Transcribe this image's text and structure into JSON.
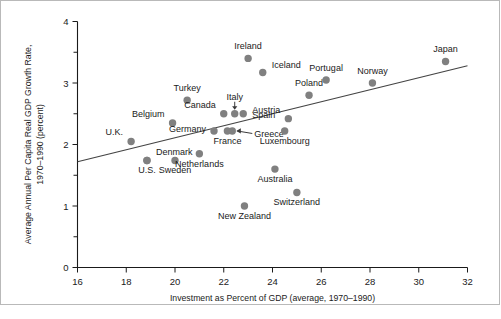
{
  "chart_data": {
    "type": "scatter",
    "title": "",
    "xlabel": "Investment as Percent of GDP (average, 1970–1990)",
    "ylabel": "Average Annual Per Capita Real GDP Growth Rate, 1970–1990 (percent)",
    "ylabel_line1": "Average Annual Per Capita Real GDP Growth Rate,",
    "ylabel_line2": "1970–1990 (percent)",
    "xlim": [
      16,
      32
    ],
    "ylim": [
      0,
      4
    ],
    "xticks": [
      16,
      18,
      20,
      22,
      24,
      26,
      28,
      30,
      32
    ],
    "xtick_labels": [
      "16",
      "18",
      "20",
      "22",
      "24",
      "26",
      "28",
      "30",
      "32"
    ],
    "yticks": [
      0,
      1,
      2,
      3,
      4
    ],
    "ytick_labels": [
      "0",
      "1",
      "2",
      "3",
      "4"
    ],
    "yticks_minor": [
      0.5,
      1.5,
      2.5,
      3.5
    ],
    "grid": false,
    "legend": null,
    "marker_color": "#808080",
    "trendline": {
      "name": "regression line",
      "x": [
        16.0,
        32.0
      ],
      "y": [
        1.72,
        3.28
      ],
      "color": "#444444"
    },
    "points": [
      {
        "label": "U.K.",
        "x": 18.2,
        "y": 2.05,
        "label_pos": "above-left"
      },
      {
        "label": "Denmark",
        "x": 18.85,
        "y": 1.74,
        "label_pos": "above-right"
      },
      {
        "label": "U.S.",
        "x": 18.85,
        "y": 1.74,
        "label_pos": "below"
      },
      {
        "label": "Belgium",
        "x": 19.9,
        "y": 2.35,
        "label_pos": "above-left"
      },
      {
        "label": "Sweden",
        "x": 20.0,
        "y": 1.74,
        "label_pos": "below"
      },
      {
        "label": "Turkey",
        "x": 20.5,
        "y": 2.72,
        "label_pos": "above"
      },
      {
        "label": "Germany",
        "x": 21.6,
        "y": 2.22,
        "label_pos": "left"
      },
      {
        "label": "Netherlands",
        "x": 21.0,
        "y": 1.85,
        "label_pos": "below"
      },
      {
        "label": "Canada",
        "x": 22.0,
        "y": 2.5,
        "label_pos": "above-left"
      },
      {
        "label": "Italy",
        "x": 22.45,
        "y": 2.5,
        "label_pos": "above-arrow"
      },
      {
        "label": "Spain",
        "x": 22.8,
        "y": 2.5,
        "label_pos": "right"
      },
      {
        "label": "France",
        "x": 22.15,
        "y": 2.22,
        "label_pos": "below"
      },
      {
        "label": "Greece",
        "x": 22.35,
        "y": 2.22,
        "label_pos": "right-arrow"
      },
      {
        "label": "Ireland",
        "x": 23.0,
        "y": 3.4,
        "label_pos": "above"
      },
      {
        "label": "New Zealand",
        "x": 22.85,
        "y": 1.0,
        "label_pos": "below"
      },
      {
        "label": "Iceland",
        "x": 23.6,
        "y": 3.17,
        "label_pos": "above-right"
      },
      {
        "label": "Australia",
        "x": 24.1,
        "y": 1.6,
        "label_pos": "below"
      },
      {
        "label": "Luxembourg",
        "x": 24.5,
        "y": 2.22,
        "label_pos": "below"
      },
      {
        "label": "Austria",
        "x": 24.65,
        "y": 2.42,
        "label_pos": "above-left"
      },
      {
        "label": "Switzerland",
        "x": 25.0,
        "y": 1.22,
        "label_pos": "below"
      },
      {
        "label": "Poland",
        "x": 25.5,
        "y": 2.8,
        "label_pos": "above"
      },
      {
        "label": "Portugal",
        "x": 26.2,
        "y": 3.05,
        "label_pos": "above"
      },
      {
        "label": "Norway",
        "x": 28.1,
        "y": 3.0,
        "label_pos": "above"
      },
      {
        "label": "Japan",
        "x": 31.1,
        "y": 3.35,
        "label_pos": "above"
      }
    ]
  }
}
